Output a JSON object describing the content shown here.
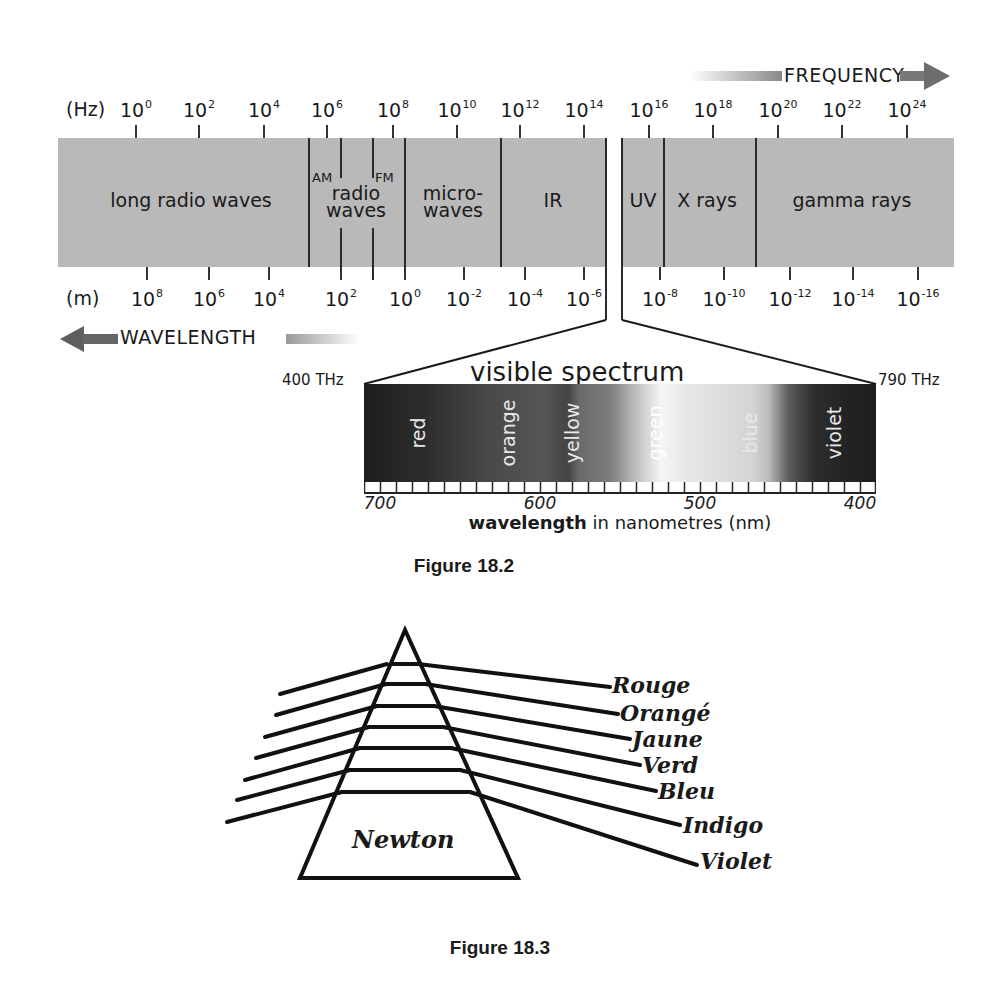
{
  "figure_18_2": {
    "caption": "Figure 18.2",
    "frequency_arrow_label": "FREQUENCY",
    "wavelength_arrow_label": "WAVELENGTH",
    "hz_unit": "(Hz)",
    "m_unit": "(m)",
    "hz_ticks": [
      {
        "base": "10",
        "exp": "0",
        "x": 136
      },
      {
        "base": "10",
        "exp": "2",
        "x": 199
      },
      {
        "base": "10",
        "exp": "4",
        "x": 264
      },
      {
        "base": "10",
        "exp": "6",
        "x": 327
      },
      {
        "base": "10",
        "exp": "8",
        "x": 393
      },
      {
        "base": "10",
        "exp": "10",
        "x": 457
      },
      {
        "base": "10",
        "exp": "12",
        "x": 520
      },
      {
        "base": "10",
        "exp": "14",
        "x": 584
      },
      {
        "base": "10",
        "exp": "16",
        "x": 649
      },
      {
        "base": "10",
        "exp": "18",
        "x": 713
      },
      {
        "base": "10",
        "exp": "20",
        "x": 778
      },
      {
        "base": "10",
        "exp": "22",
        "x": 842
      },
      {
        "base": "10",
        "exp": "24",
        "x": 907
      }
    ],
    "m_ticks": [
      {
        "base": "10",
        "exp": "8",
        "x": 147
      },
      {
        "base": "10",
        "exp": "6",
        "x": 209
      },
      {
        "base": "10",
        "exp": "4",
        "x": 269
      },
      {
        "base": "10",
        "exp": "2",
        "x": 341
      },
      {
        "base": "10",
        "exp": "0",
        "x": 405
      },
      {
        "base": "10",
        "exp": "-2",
        "x": 464
      },
      {
        "base": "10",
        "exp": "-4",
        "x": 525
      },
      {
        "base": "10",
        "exp": "-6",
        "x": 584
      },
      {
        "base": "10",
        "exp": "-8",
        "x": 660
      },
      {
        "base": "10",
        "exp": "-10",
        "x": 724
      },
      {
        "base": "10",
        "exp": "-12",
        "x": 790
      },
      {
        "base": "10",
        "exp": "-14",
        "x": 853
      },
      {
        "base": "10",
        "exp": "-16",
        "x": 918
      }
    ],
    "regions": [
      {
        "label": "long radio waves",
        "x": 191,
        "lines": 1
      },
      {
        "label": "radio\nwaves",
        "x": 356,
        "lines": 2
      },
      {
        "label": "micro-\nwaves",
        "x": 453,
        "lines": 2
      },
      {
        "label": "IR",
        "x": 553,
        "lines": 1
      },
      {
        "label": "UV",
        "x": 643,
        "lines": 1
      },
      {
        "label": "X rays",
        "x": 707,
        "lines": 1
      },
      {
        "label": "gamma rays",
        "x": 852,
        "lines": 1
      }
    ],
    "sub_labels": {
      "am": "AM",
      "fm": "FM"
    },
    "visible_spectrum": {
      "title": "visible spectrum",
      "left_freq": "400 THz",
      "right_freq": "790 THz",
      "colors": [
        {
          "label": "red",
          "x": 418
        },
        {
          "label": "orange",
          "x": 508
        },
        {
          "label": "yellow",
          "x": 572
        },
        {
          "label": "green",
          "x": 655
        },
        {
          "label": "blue",
          "x": 750
        },
        {
          "label": "violet",
          "x": 834
        }
      ],
      "nm_ticks": [
        {
          "label": "700",
          "x": 380
        },
        {
          "label": "600",
          "x": 540
        },
        {
          "label": "500",
          "x": 700
        },
        {
          "label": "400",
          "x": 860
        }
      ],
      "axis_label_bold": "wavelength",
      "axis_label_rest": " in nanometres (nm)"
    }
  },
  "figure_18_3": {
    "caption": "Figure 18.3",
    "prism_label": "Newton",
    "color_names": [
      "Rouge",
      "Orangé",
      "Jaune",
      "Verd",
      "Bleu",
      "Indigo",
      "Violet"
    ]
  }
}
